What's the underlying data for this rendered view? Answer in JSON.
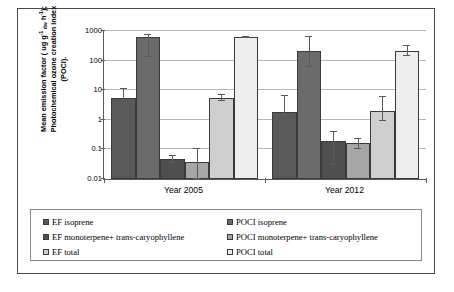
{
  "chart_data": {
    "type": "bar",
    "title": "",
    "xlabel": "",
    "ylabel": "Mean emission factor ( ug g-1 dw h-1); Photochemical ozone creation index (POCI).",
    "categories": [
      "Year 2005",
      "Year 2012"
    ],
    "yscale": "log",
    "ylim": [
      0.01,
      1000
    ],
    "ytick_labels": [
      "1000",
      "100",
      "10",
      "1",
      "0.1",
      "0.01"
    ],
    "ytick_values": [
      1000,
      100,
      10,
      1,
      0.1,
      0.01
    ],
    "grid": true,
    "legend_position": "bottom",
    "series": [
      {
        "name": "EF isoprene",
        "color": "#595959",
        "values": [
          5.5,
          1.9
        ],
        "err_low": [
          2.3,
          1.05
        ],
        "err_high": [
          5.5,
          4.3
        ]
      },
      {
        "name": "POCI isoprene",
        "color": "#6b6b6b",
        "values": [
          620,
          210
        ],
        "err_low": [
          490,
          150
        ],
        "err_high": [
          120,
          400
        ]
      },
      {
        "name": "EF monoterpene+ trans-caryophyllene",
        "color": "#4f4f4f",
        "values": [
          0.047,
          0.19
        ],
        "err_low": [
          0.011,
          0.16
        ],
        "err_high": [
          0.014,
          0.21
        ]
      },
      {
        "name": "POCI monoterpene+ trans-caryophyllene",
        "color": "#a6a6a6",
        "values": [
          0.039,
          0.16
        ],
        "err_low": [
          0.029,
          0.055
        ],
        "err_high": [
          0.061,
          0.06
        ]
      },
      {
        "name": "EF total",
        "color": "#cfcfcf",
        "values": [
          5.6,
          2.0
        ],
        "err_low": [
          1.3,
          1.1
        ],
        "err_high": [
          1.4,
          3.9
        ]
      },
      {
        "name": "POCI total",
        "color": "#ededed",
        "values": [
          620,
          210
        ],
        "err_low": [
          20,
          70
        ],
        "err_high": [
          20,
          90
        ]
      }
    ]
  },
  "yaxis": {
    "line1_a": "Mean emission factor ( ug g",
    "line1_sup": "-1",
    "line1_sub": " dw",
    "line1_b": "  h",
    "line1_sup2": "-1",
    "line1_c": ");",
    "line2": "Photochemical ozone creation index",
    "line3": "(POCI)."
  },
  "legend": {
    "rows": [
      {
        "left": {
          "label": "EF isoprene",
          "color": "#595959"
        },
        "right": {
          "label": "POCI isoprene",
          "color": "#6b6b6b"
        }
      },
      {
        "left": {
          "label": "EF monoterpene+ trans-caryophyllene",
          "color": "#4f4f4f"
        },
        "right": {
          "label": "POCI monoterpene+ trans-caryophyllene",
          "color": "#a6a6a6"
        }
      },
      {
        "left": {
          "label": "EF total",
          "color": "#cfcfcf"
        },
        "right": {
          "label": "POCI total",
          "color": "#ededed"
        }
      }
    ]
  }
}
